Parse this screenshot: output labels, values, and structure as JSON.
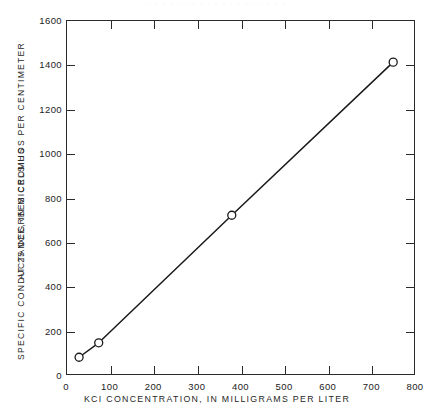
{
  "figure": {
    "header_fragment": "· · · · · · · · · · · · · · · · · · ·",
    "page_number": "21"
  },
  "chart_data": {
    "type": "line",
    "title": "",
    "subtitle": "",
    "xlabel": "KCI CONCENTRATION, IN MILLIGRAMS PER LITER",
    "ylabel_line1": "SPECIFIC CONDUCTANCE, IN MICROMHOS PER CENTIMETER",
    "ylabel_line2": "AT 25 DEGREES CELSIUS",
    "xlim": [
      0,
      800
    ],
    "ylim": [
      0,
      1600
    ],
    "xticks": [
      0,
      100,
      200,
      300,
      400,
      500,
      600,
      700,
      800
    ],
    "yticks": [
      0,
      200,
      400,
      600,
      800,
      1000,
      1200,
      1400,
      1600
    ],
    "xticklabels": [
      "0",
      "100",
      "200",
      "300",
      "400",
      "500",
      "600",
      "700",
      "800"
    ],
    "yticklabels": [
      "0",
      "200",
      "400",
      "600",
      "800",
      "1000",
      "1200",
      "1400",
      "1600"
    ],
    "grid": false,
    "legend": null,
    "marker": "open-circle",
    "line_color": "#1a1a1a",
    "marker_edge_color": "#1a1a1a",
    "marker_face_color": "#ffffff",
    "series": [
      {
        "name": "KCl standard solutions",
        "x": [
          30,
          75,
          380,
          750
        ],
        "y": [
          80,
          145,
          720,
          1410
        ]
      }
    ]
  }
}
